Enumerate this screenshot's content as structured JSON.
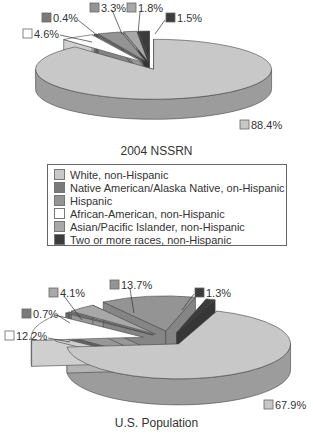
{
  "chart_data": [
    {
      "type": "pie",
      "title": "2004 NSSRN",
      "slices": [
        {
          "category": "White, non-Hispanic",
          "value": 88.4,
          "label": "88.4%"
        },
        {
          "category": "African-American, non-Hispanic",
          "value": 4.6,
          "label": "4.6%"
        },
        {
          "category": "Native American/Alaska Native, on-Hispanic",
          "value": 0.4,
          "label": "0.4%"
        },
        {
          "category": "Hispanic",
          "value": 3.3,
          "label": "3.3%"
        },
        {
          "category": "Asian/Pacific Islander, non-Hispanic",
          "value": 1.8,
          "label": "1.8%"
        },
        {
          "category": "Two or more races, non-Hispanic",
          "value": 1.5,
          "label": "1.5%"
        }
      ],
      "style": "3d-exploded"
    },
    {
      "type": "pie",
      "title": "U.S. Population",
      "slices": [
        {
          "category": "White, non-Hispanic",
          "value": 67.9,
          "label": "67.9%"
        },
        {
          "category": "African-American, non-Hispanic",
          "value": 12.2,
          "label": "12.2%"
        },
        {
          "category": "Native American/Alaska Native, on-Hispanic",
          "value": 0.7,
          "label": "0.7%"
        },
        {
          "category": "Asian/Pacific Islander, non-Hispanic",
          "value": 4.1,
          "label": "4.1%"
        },
        {
          "category": "Hispanic",
          "value": 13.7,
          "label": "13.7%"
        },
        {
          "category": "Two or more races, non-Hispanic",
          "value": 1.3,
          "label": "1.3%"
        }
      ],
      "style": "3d-exploded"
    }
  ],
  "legend": {
    "items": [
      {
        "label": "White, non-Hispanic",
        "color": "#c8c8c8"
      },
      {
        "label": "Native American/Alaska Native, on-Hispanic",
        "color": "#7a7a7a"
      },
      {
        "label": "Hispanic",
        "color": "#949494"
      },
      {
        "label": "African-American, non-Hispanic",
        "color": "#ffffff"
      },
      {
        "label": "Asian/Pacific Islander, non-Hispanic",
        "color": "#a8a8a8"
      },
      {
        "label": "Two or more races, non-Hispanic",
        "color": "#3c3c3c"
      }
    ]
  },
  "titles": {
    "top": "2004 NSSRN",
    "bottom": "U.S. Population"
  }
}
